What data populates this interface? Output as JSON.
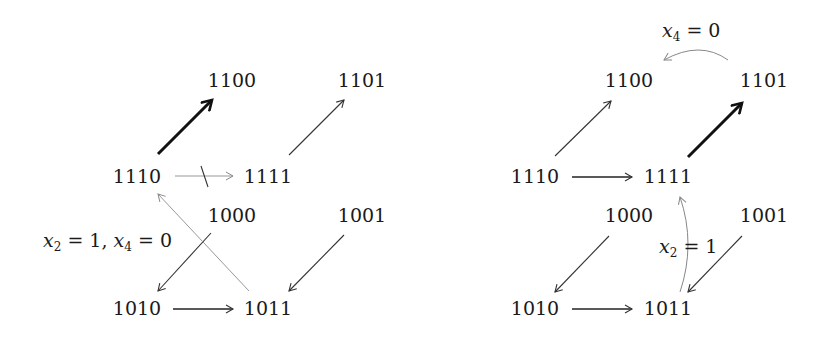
{
  "diagrams": [
    {
      "id": "left",
      "nodes": {
        "n1100": "1100",
        "n1101": "1101",
        "n1110": "1110",
        "n1111": "1111",
        "n1000": "1000",
        "n1001": "1001",
        "n1010": "1010",
        "n1011": "1011"
      },
      "edges": [
        {
          "from": "1110",
          "to": "1100",
          "style": "bold"
        },
        {
          "from": "1111",
          "to": "1101",
          "style": "normal"
        },
        {
          "from": "1110",
          "to": "1111",
          "style": "light",
          "crossed": true
        },
        {
          "from": "1000",
          "to": "1010",
          "style": "normal",
          "crossed": true
        },
        {
          "from": "1001",
          "to": "1011",
          "style": "normal"
        },
        {
          "from": "1010",
          "to": "1011",
          "style": "normal"
        },
        {
          "from": "1011",
          "to": "1110",
          "style": "light"
        }
      ],
      "annotation": {
        "var1": "x",
        "sub1": "2",
        "val1": "1",
        "var2": "x",
        "sub2": "4",
        "val2": "0"
      }
    },
    {
      "id": "right",
      "nodes": {
        "n1100": "1100",
        "n1101": "1101",
        "n1110": "1110",
        "n1111": "1111",
        "n1000": "1000",
        "n1001": "1001",
        "n1010": "1010",
        "n1011": "1011"
      },
      "edges": [
        {
          "from": "1110",
          "to": "1100",
          "style": "normal"
        },
        {
          "from": "1111",
          "to": "1101",
          "style": "bold"
        },
        {
          "from": "1110",
          "to": "1111",
          "style": "normal"
        },
        {
          "from": "1000",
          "to": "1010",
          "style": "normal"
        },
        {
          "from": "1001",
          "to": "1011",
          "style": "normal"
        },
        {
          "from": "1010",
          "to": "1011",
          "style": "normal"
        },
        {
          "from": "1101",
          "to": "1100",
          "style": "light",
          "curved": true,
          "label": "x4 = 0"
        },
        {
          "from": "1011",
          "to": "1111",
          "style": "light",
          "curved": true,
          "label": "x2 = 1"
        }
      ],
      "annotation_top": {
        "var": "x",
        "sub": "4",
        "val": "0"
      },
      "annotation_mid": {
        "var": "x",
        "sub": "2",
        "val": "1"
      }
    }
  ]
}
